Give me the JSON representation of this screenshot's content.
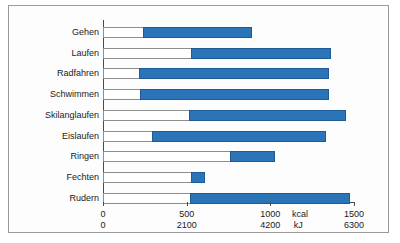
{
  "chart_data": {
    "type": "bar",
    "orientation": "horizontal",
    "title": "",
    "xlabel": "",
    "ylabel": "",
    "grid": false,
    "legend": null,
    "note": "Each bar spans from a lower value (end of white segment) to an upper value (end of blue segment); the blue segment is the highlighted range.",
    "categories": [
      "Gehen",
      "Laufen",
      "Radfahren",
      "Schwimmen",
      "Skilanglaufen",
      "Eislaufen",
      "Ringen",
      "Fechten",
      "Rudern"
    ],
    "series": [
      {
        "name": "Bereichsanfang",
        "unit": "kcal",
        "values": [
          240,
          525,
          215,
          220,
          515,
          290,
          760,
          525,
          520
        ]
      },
      {
        "name": "Bereichsende",
        "unit": "kcal",
        "values": [
          890,
          1360,
          1350,
          1350,
          1455,
          1330,
          1030,
          610,
          1475
        ]
      }
    ],
    "axes": {
      "primary": {
        "unit": "kcal",
        "ticks": [
          0,
          500,
          1000,
          1500
        ],
        "tick_labels": [
          "0",
          "500",
          "1000",
          "1500"
        ],
        "range": [
          0,
          1500
        ]
      },
      "secondary": {
        "unit": "kJ",
        "ticks": [
          0,
          2100,
          4200,
          6300
        ],
        "tick_labels": [
          "0",
          "2100",
          "4200",
          "6300"
        ],
        "range": [
          0,
          6300
        ]
      }
    },
    "colors": {
      "bar_fill": "#2b74b8",
      "bar_fill_border": "#1d5a96",
      "bar_track": "#ffffff",
      "bar_track_border": "#8d8d8d",
      "axis": "#4a4a4a",
      "frame": "#9a9a9a",
      "background": "#fdfdfd",
      "text": "#1a1a1a"
    }
  }
}
